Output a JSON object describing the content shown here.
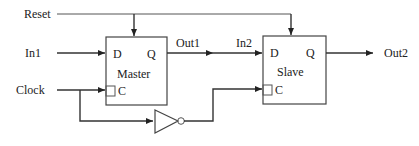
{
  "diagram": {
    "type": "master-slave flip-flop",
    "inputs": {
      "reset": "Reset",
      "in1": "In1",
      "clock": "Clock"
    },
    "signals": {
      "out1": "Out1",
      "in2": "In2",
      "out2": "Out2"
    },
    "master": {
      "name": "Master",
      "d": "D",
      "q": "Q",
      "c": "C"
    },
    "slave": {
      "name": "Slave",
      "d": "D",
      "q": "Q",
      "c": "C"
    },
    "inverter": "not-gate"
  }
}
